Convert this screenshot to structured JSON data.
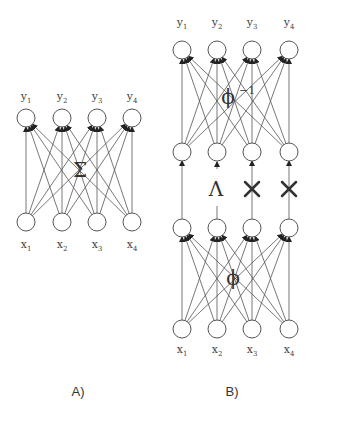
{
  "panels": [
    {
      "caption": "A)",
      "layers": [
        {
          "labels": [
            [
              "x",
              "1"
            ],
            [
              "x",
              "2"
            ],
            [
              "x",
              "3"
            ],
            [
              "x",
              "4"
            ]
          ]
        },
        {
          "labels": [
            [
              "y",
              "1"
            ],
            [
              "y",
              "2"
            ],
            [
              "y",
              "3"
            ],
            [
              "y",
              "4"
            ]
          ]
        }
      ],
      "operator": "Σ"
    },
    {
      "caption": "B)",
      "bottom_labels": [
        [
          "x",
          "1"
        ],
        [
          "x",
          "2"
        ],
        [
          "x",
          "3"
        ],
        [
          "x",
          "4"
        ]
      ],
      "top_labels": [
        [
          "y",
          "1"
        ],
        [
          "y",
          "2"
        ],
        [
          "y",
          "3"
        ],
        [
          "y",
          "4"
        ]
      ],
      "lower_operator": "ϕ",
      "upper_operator": "ϕ",
      "upper_operator_sup": "−1",
      "middle_operator": "Λ",
      "middle_markers": [
        "arrow",
        "lambda",
        "cross",
        "cross"
      ]
    }
  ]
}
